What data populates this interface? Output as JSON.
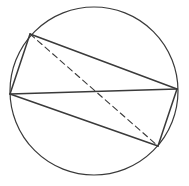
{
  "diagram": {
    "circle": {
      "cx": 94,
      "cy": 91,
      "r": 84
    },
    "points": {
      "A": [
        30,
        34
      ],
      "B": [
        177,
        89
      ],
      "C": [
        158,
        146
      ],
      "D": [
        10,
        94
      ]
    },
    "edges": [
      {
        "from": "A",
        "to": "B",
        "style": "solid"
      },
      {
        "from": "B",
        "to": "C",
        "style": "solid"
      },
      {
        "from": "C",
        "to": "D",
        "style": "solid"
      },
      {
        "from": "D",
        "to": "A",
        "style": "solid"
      },
      {
        "from": "D",
        "to": "B",
        "style": "solid"
      },
      {
        "from": "A",
        "to": "C",
        "style": "dashed"
      }
    ],
    "colors": {
      "stroke": "#3a3a3a",
      "background": "#ffffff"
    }
  }
}
